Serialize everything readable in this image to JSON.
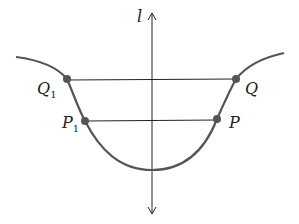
{
  "diagram": {
    "axis_label": "l",
    "points": [
      {
        "name": "Q1",
        "base": "Q",
        "sub": "1"
      },
      {
        "name": "Q",
        "base": "Q",
        "sub": ""
      },
      {
        "name": "P1",
        "base": "P",
        "sub": "1"
      },
      {
        "name": "P",
        "base": "P",
        "sub": ""
      }
    ],
    "colors": {
      "curve": "#555555",
      "points": "#555555",
      "lines": "#222222"
    }
  }
}
